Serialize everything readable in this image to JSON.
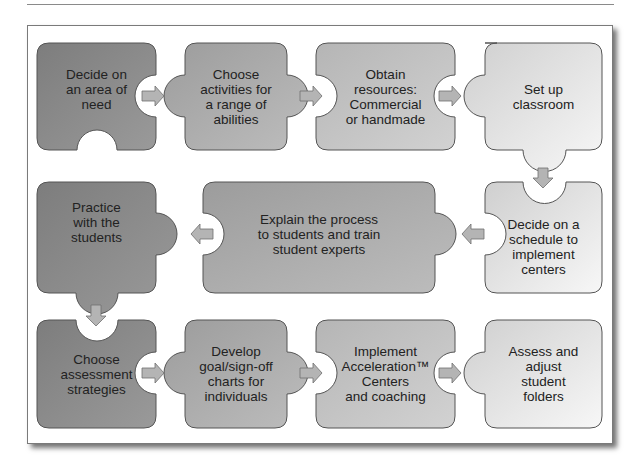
{
  "diagram": {
    "type": "puzzle-piece flowchart",
    "steps": [
      {
        "id": 1,
        "label": "Decide on an area of need",
        "lines": [
          "Decide on",
          "an area of",
          "need"
        ],
        "shade": "#8a8a8a"
      },
      {
        "id": 2,
        "label": "Choose activities for a range of abilities",
        "lines": [
          "Choose",
          "activities for",
          "a range of",
          "abilities"
        ],
        "shade": "#a8a8a8"
      },
      {
        "id": 3,
        "label": "Obtain resources: Commercial or handmade",
        "lines": [
          "Obtain",
          "resources:",
          "Commercial",
          "or handmade"
        ],
        "shade": "#bdbdbd"
      },
      {
        "id": 4,
        "label": "Set up classroom",
        "lines": [
          "Set up",
          "classroom"
        ],
        "shade": "#dcdcdc"
      },
      {
        "id": 5,
        "label": "Decide on a schedule to implement centers",
        "lines": [
          "Decide on a",
          "schedule to",
          "implement",
          "centers"
        ],
        "shade": "#d4d4d4"
      },
      {
        "id": 6,
        "label": "Explain the process to students and train student experts",
        "lines": [
          "Explain the process",
          "to students and train",
          "student experts"
        ],
        "shade": "#ababab"
      },
      {
        "id": 7,
        "label": "Practice with the students",
        "lines": [
          "Practice",
          "with the",
          "students"
        ],
        "shade": "#8a8a8a"
      },
      {
        "id": 8,
        "label": "Choose assessment strategies",
        "lines": [
          "Choose",
          "assessment",
          "strategies"
        ],
        "shade": "#8a8a8a"
      },
      {
        "id": 9,
        "label": "Develop goal/sign-off charts for individuals",
        "lines": [
          "Develop",
          "goal/sign-off",
          "charts for",
          "individuals"
        ],
        "shade": "#a8a8a8"
      },
      {
        "id": 10,
        "label": "Implement Acceleration™ Centers and coaching",
        "lines": [
          "Implement",
          "Acceleration™",
          "Centers",
          "and coaching"
        ],
        "shade": "#bdbdbd"
      },
      {
        "id": 11,
        "label": "Assess and adjust student folders",
        "lines": [
          "Assess and",
          "adjust",
          "student",
          "folders"
        ],
        "shade": "#dcdcdc"
      }
    ],
    "flow": [
      "1→2",
      "2→3",
      "3→4",
      "4↓5",
      "5←6",
      "6←7",
      "7↓8",
      "8→9",
      "9→10",
      "10→11"
    ],
    "colors": {
      "arrow_fill": "#b4b4b4",
      "arrow_stroke": "#6e6e6e",
      "tile_stroke": "#555555",
      "text": "#222222"
    }
  }
}
